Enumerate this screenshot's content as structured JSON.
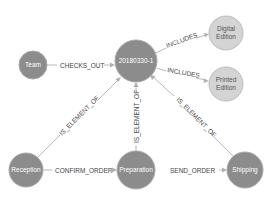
{
  "graph": {
    "nodes": [
      {
        "id": "team",
        "label": "Team",
        "style": "dark"
      },
      {
        "id": "order",
        "label": "20180330-1",
        "style": "dark"
      },
      {
        "id": "digital",
        "label_lines": [
          "Digital",
          "Edition"
        ],
        "style": "light"
      },
      {
        "id": "printed",
        "label_lines": [
          "Printed",
          "Edition"
        ],
        "style": "light"
      },
      {
        "id": "reception",
        "label": "Reception",
        "style": "dark"
      },
      {
        "id": "preparation",
        "label": "Preparation",
        "style": "dark"
      },
      {
        "id": "shipping",
        "label": "Shipping",
        "style": "dark"
      }
    ],
    "edges": [
      {
        "from": "team",
        "to": "order",
        "label": "CHECKS_OUT"
      },
      {
        "from": "order",
        "to": "digital",
        "label": "INCLUDES"
      },
      {
        "from": "order",
        "to": "printed",
        "label": "INCLUDES"
      },
      {
        "from": "reception",
        "to": "order",
        "label": "IS_ELEMENT_OF"
      },
      {
        "from": "preparation",
        "to": "order",
        "label": "IS_ELEMENT_OF"
      },
      {
        "from": "shipping",
        "to": "order",
        "label": "IS_ELEMENT_OF"
      },
      {
        "from": "reception",
        "to": "preparation",
        "label": "CONFIRM_ORDER"
      },
      {
        "from": "preparation",
        "to": "shipping",
        "label": "SEND_ORDER"
      }
    ],
    "colors": {
      "dark_node": "#8c8c8c",
      "light_node": "#d4d4d4",
      "edge": "#b8b8b8",
      "edge_label": "#444444"
    }
  }
}
